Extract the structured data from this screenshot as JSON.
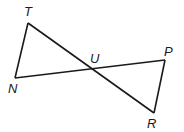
{
  "diagram": {
    "type": "geometry",
    "points": {
      "T": {
        "label": "T",
        "x": 28,
        "y": 23,
        "lx": 24,
        "ly": 16
      },
      "N": {
        "label": "N",
        "x": 15,
        "y": 78,
        "lx": 8,
        "ly": 93
      },
      "U": {
        "label": "U",
        "x": 92,
        "y": 69,
        "lx": 90,
        "ly": 63
      },
      "P": {
        "label": "P",
        "x": 165,
        "y": 60,
        "lx": 164,
        "ly": 56
      },
      "R": {
        "label": "R",
        "x": 154,
        "y": 113,
        "lx": 147,
        "ly": 128
      }
    },
    "segments": [
      {
        "from": "T",
        "to": "N"
      },
      {
        "from": "T",
        "to": "R"
      },
      {
        "from": "N",
        "to": "P"
      },
      {
        "from": "P",
        "to": "R"
      }
    ],
    "colors": {
      "line": "#1a1a1a",
      "background": "#ffffff"
    }
  }
}
